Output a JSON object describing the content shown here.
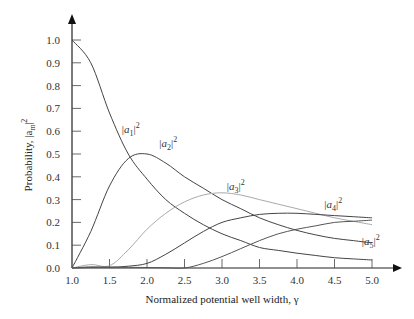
{
  "chart_data": {
    "type": "line",
    "title": "",
    "xlabel": "Normalized potential well width, γ",
    "ylabel": "Probability, |a_m|²",
    "xlim": [
      1.0,
      5.0
    ],
    "ylim": [
      0.0,
      1.0
    ],
    "grid": false,
    "legend": "inline labels",
    "x_ticks": [
      "1.0",
      "1.5",
      "2.0",
      "2.5",
      "3.0",
      "3.5",
      "4.0",
      "4.5",
      "5.0"
    ],
    "y_ticks": [
      "0.0",
      "0.1",
      "0.2",
      "0.3",
      "0.4",
      "0.5",
      "0.6",
      "0.7",
      "0.8",
      "0.9",
      "1.0"
    ],
    "x": [
      1.0,
      1.25,
      1.5,
      1.75,
      2.0,
      2.25,
      2.5,
      2.75,
      3.0,
      3.25,
      3.5,
      3.75,
      4.0,
      4.25,
      4.5,
      4.75,
      5.0
    ],
    "series": [
      {
        "name": "|a1|²",
        "color": "#444444",
        "values": [
          1.0,
          0.9,
          0.68,
          0.5,
          0.39,
          0.3,
          0.24,
          0.19,
          0.15,
          0.12,
          0.09,
          0.077,
          0.065,
          0.055,
          0.045,
          0.04,
          0.035
        ]
      },
      {
        "name": "|a2|²",
        "color": "#444444",
        "values": [
          0.0,
          0.16,
          0.36,
          0.48,
          0.5,
          0.46,
          0.4,
          0.35,
          0.3,
          0.26,
          0.22,
          0.19,
          0.165,
          0.145,
          0.13,
          0.12,
          0.11
        ]
      },
      {
        "name": "|a3|²",
        "color": "#aaaaaa",
        "values": [
          0.0,
          0.015,
          0.01,
          0.08,
          0.17,
          0.24,
          0.29,
          0.32,
          0.33,
          0.32,
          0.3,
          0.28,
          0.26,
          0.24,
          0.22,
          0.205,
          0.19
        ]
      },
      {
        "name": "|a4|²",
        "color": "#444444",
        "values": [
          0.0,
          0.005,
          0.003,
          0.008,
          0.02,
          0.06,
          0.11,
          0.16,
          0.2,
          0.22,
          0.235,
          0.24,
          0.24,
          0.235,
          0.23,
          0.225,
          0.22
        ]
      },
      {
        "name": "|a5|²",
        "color": "#555555",
        "values": [
          0.0,
          0.002,
          0.004,
          0.003,
          0.002,
          0.001,
          0.0,
          0.02,
          0.05,
          0.085,
          0.12,
          0.15,
          0.17,
          0.185,
          0.2,
          0.205,
          0.21
        ]
      }
    ],
    "annotations": [
      {
        "text": "|a1|²",
        "x": 1.85,
        "y": 0.61
      },
      {
        "text": "|a2|²",
        "x": 2.35,
        "y": 0.55
      },
      {
        "text": "|a3|²",
        "x": 3.25,
        "y": 0.36
      },
      {
        "text": "|a4|²",
        "x": 4.55,
        "y": 0.28
      },
      {
        "text": "|a5|²",
        "x": 5.05,
        "y": 0.12
      }
    ]
  },
  "labels": {
    "xlabel": "Normalized potential well width, γ",
    "ylabel_prefix": "Probability, |a",
    "ylabel_sub": "m",
    "ylabel_suffix": "|",
    "ylabel_sup": "2"
  }
}
